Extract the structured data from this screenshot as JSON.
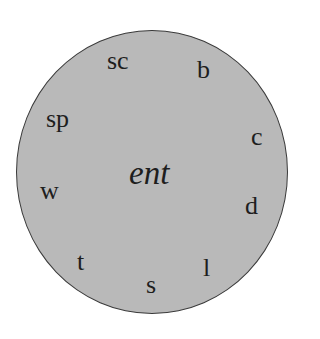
{
  "diagram": {
    "type": "word-wheel",
    "center": {
      "text": "ent"
    },
    "onsets": [
      {
        "text": "sc"
      },
      {
        "text": "b"
      },
      {
        "text": "sp"
      },
      {
        "text": "c"
      },
      {
        "text": "w"
      },
      {
        "text": "d"
      },
      {
        "text": "t"
      },
      {
        "text": "l"
      },
      {
        "text": "s"
      }
    ],
    "colors": {
      "fill": "#b9b9b9",
      "border": "#3a3a3a",
      "text": "#1e1e1e"
    }
  }
}
